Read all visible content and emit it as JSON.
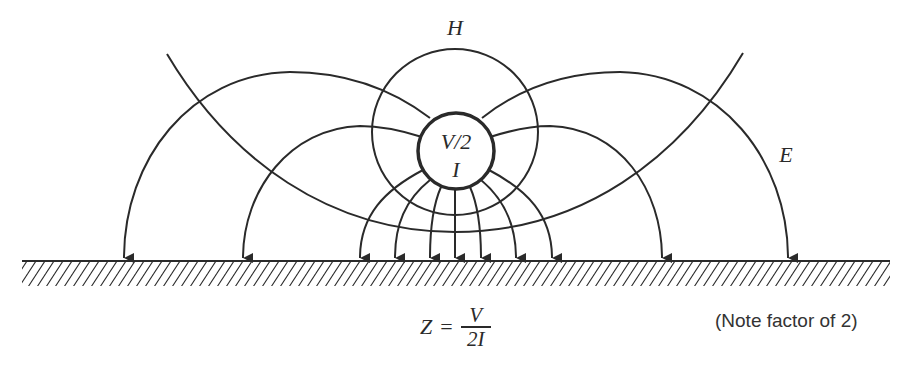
{
  "diagram": {
    "labels": {
      "magnetic_field": "H",
      "electric_field": "E",
      "conductor_voltage": "V/2",
      "conductor_current": "I"
    },
    "formula": {
      "lhs": "Z",
      "equals": "=",
      "numerator": "V",
      "denominator": "2I"
    },
    "note": "(Note factor of 2)",
    "colors": {
      "stroke": "#2a2a2a",
      "background": "#ffffff"
    },
    "conductor": {
      "cx": 456,
      "cy": 151,
      "r": 38
    },
    "h_circle": {
      "cx": 455,
      "cy": 132,
      "r": 83
    },
    "ground_line_y": 261,
    "arrow_x_positions": [
      124,
      243,
      360,
      395,
      430,
      455,
      481,
      516,
      552,
      662,
      788
    ]
  }
}
